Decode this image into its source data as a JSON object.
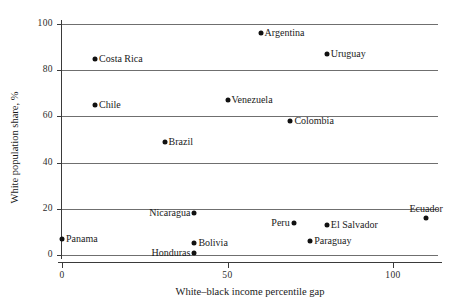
{
  "chart_data": {
    "type": "scatter",
    "title": "",
    "xlabel": "White–black income percentile gap",
    "ylabel": "White population share, %",
    "xlim": [
      -3,
      116
    ],
    "ylim": [
      -3,
      103
    ],
    "xticks": [
      0,
      50,
      100
    ],
    "xtick_labels": [
      "0",
      "50",
      "100"
    ],
    "yticks": [
      0,
      20,
      40,
      60,
      80,
      100
    ],
    "ytick_labels": [
      "0",
      "20",
      "40",
      "60",
      "80",
      "100"
    ],
    "grid": "horizontal",
    "legend": "none",
    "points": [
      {
        "name": "Argentina",
        "x": 60,
        "y": 96,
        "label_pos": "right"
      },
      {
        "name": "Uruguay",
        "x": 80,
        "y": 87,
        "label_pos": "right"
      },
      {
        "name": "Costa Rica",
        "x": 10,
        "y": 85,
        "label_pos": "right"
      },
      {
        "name": "Chile",
        "x": 10,
        "y": 65,
        "label_pos": "right"
      },
      {
        "name": "Venezuela",
        "x": 50,
        "y": 67,
        "label_pos": "right"
      },
      {
        "name": "Colombia",
        "x": 69,
        "y": 58,
        "label_pos": "right"
      },
      {
        "name": "Brazil",
        "x": 31,
        "y": 49,
        "label_pos": "right"
      },
      {
        "name": "Nicaragua",
        "x": 40,
        "y": 18,
        "label_pos": "left"
      },
      {
        "name": "Peru",
        "x": 70,
        "y": 14,
        "label_pos": "left"
      },
      {
        "name": "El Salvador",
        "x": 80,
        "y": 13,
        "label_pos": "right"
      },
      {
        "name": "Ecuador",
        "x": 110,
        "y": 16,
        "label_pos": "above"
      },
      {
        "name": "Panama",
        "x": 0,
        "y": 7,
        "label_pos": "right"
      },
      {
        "name": "Bolivia",
        "x": 40,
        "y": 5,
        "label_pos": "right"
      },
      {
        "name": "Paraguay",
        "x": 75,
        "y": 6,
        "label_pos": "right"
      },
      {
        "name": "Honduras",
        "x": 40,
        "y": 1,
        "label_pos": "left"
      }
    ]
  }
}
